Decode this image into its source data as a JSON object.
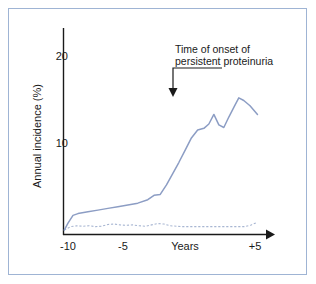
{
  "figure": {
    "border_color": "#9fb4d4",
    "background": "#ffffff"
  },
  "annotation": {
    "line1": "Time of onset of",
    "line2": "persistent proteinuria"
  },
  "axes": {
    "y_title": "Annual incidence (%)",
    "x_title": "Years",
    "y_ticks": [
      "10",
      "20"
    ],
    "x_ticks": [
      "-10",
      "-5",
      "+5"
    ]
  },
  "chart_data": {
    "type": "line",
    "title": "",
    "subtitle": "",
    "xlabel": "Years",
    "ylabel": "Annual incidence (%)",
    "xlim": [
      -10.5,
      5.6
    ],
    "ylim": [
      0,
      22
    ],
    "grid": false,
    "legend": false,
    "y_tick_values": [
      10,
      20
    ],
    "x_tick_values": [
      -10,
      -5,
      5
    ],
    "annotations": [
      {
        "text": "Time of onset of persistent proteinuria",
        "points_to_x": 0,
        "points_to_y": 16.5,
        "arrow": "down"
      }
    ],
    "series": [
      {
        "name": "persistent-proteinuria-incidence",
        "color": "#8c9dc4",
        "style": "solid",
        "x": [
          -10.3,
          -10.0,
          -9.6,
          -9.2,
          -8.4,
          -7.6,
          -6.8,
          -6.0,
          -5.2,
          -4.4,
          -3.6,
          -3.1,
          -2.6,
          -2.1,
          -1.6,
          -1.1,
          -0.6,
          -0.1,
          0.4,
          0.9,
          1.3,
          1.7,
          2.1,
          2.5,
          2.9,
          3.3,
          3.7,
          4.1,
          4.6,
          5.2
        ],
        "y": [
          0.1,
          0.9,
          1.8,
          2.0,
          2.2,
          2.4,
          2.6,
          2.8,
          3.0,
          3.2,
          3.6,
          4.1,
          4.2,
          5.3,
          6.6,
          7.9,
          9.3,
          10.7,
          11.6,
          11.8,
          12.3,
          13.4,
          12.2,
          11.9,
          13.1,
          14.2,
          15.3,
          15.0,
          14.4,
          13.4
        ]
      },
      {
        "name": "baseline-comparison-incidence",
        "color": "#a8b6d2",
        "style": "dotted",
        "x": [
          -10.3,
          -9.8,
          -9.3,
          -8.8,
          -8.3,
          -7.8,
          -7.3,
          -6.8,
          -6.3,
          -5.8,
          -5.3,
          -4.8,
          -4.3,
          -3.8,
          -3.3,
          -2.8,
          -2.3,
          -1.8,
          -1.3,
          -0.8,
          -0.3,
          0.2,
          0.7,
          1.2,
          1.7,
          2.2,
          2.7,
          3.2,
          3.7,
          4.2,
          4.7,
          5.2
        ],
        "y": [
          0.1,
          0.5,
          0.6,
          0.55,
          0.6,
          0.5,
          0.55,
          0.75,
          0.8,
          0.7,
          0.65,
          0.7,
          0.6,
          0.55,
          0.7,
          0.85,
          0.8,
          0.6,
          0.55,
          0.5,
          0.5,
          0.5,
          0.5,
          0.5,
          0.5,
          0.5,
          0.5,
          0.5,
          0.5,
          0.5,
          0.7,
          1.0
        ]
      }
    ]
  }
}
